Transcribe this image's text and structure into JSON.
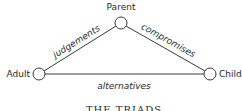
{
  "diagram": {
    "nodes": [
      {
        "id": "parent",
        "label": "Parent"
      },
      {
        "id": "adult",
        "label": "Adult"
      },
      {
        "id": "child",
        "label": "Child"
      }
    ],
    "edges": [
      {
        "from": "adult",
        "to": "parent",
        "label": "judgements"
      },
      {
        "from": "parent",
        "to": "child",
        "label": "compromises"
      },
      {
        "from": "adult",
        "to": "child",
        "label": "alternatives"
      }
    ],
    "caption": "THE TRIADS"
  },
  "colors": {
    "stroke": "#3a3a3a",
    "text": "#2a2a2a",
    "background": "#ffffff"
  }
}
